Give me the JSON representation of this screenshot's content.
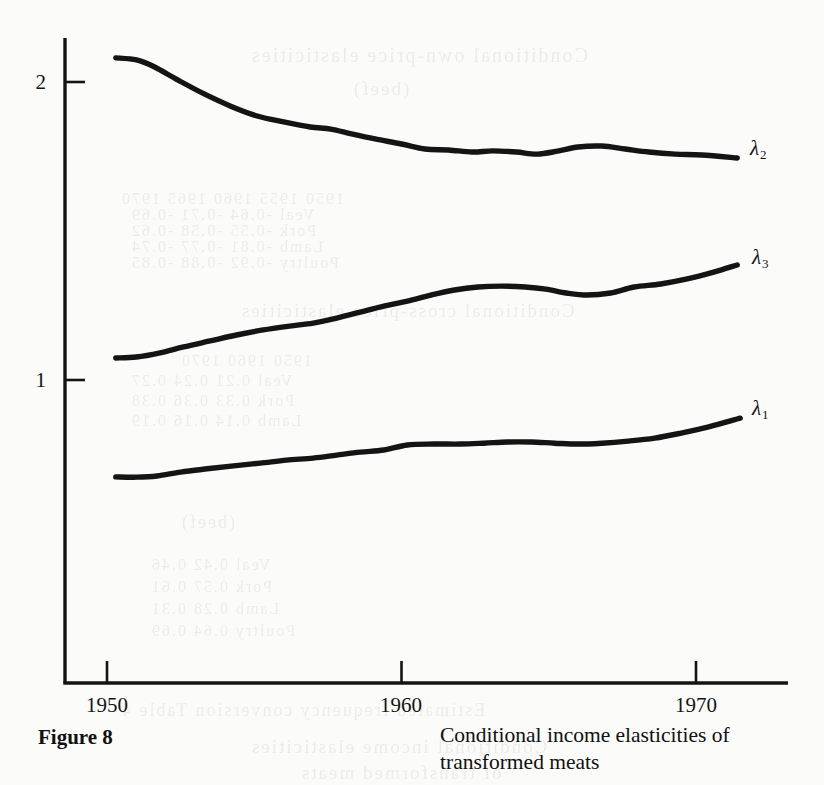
{
  "figure": {
    "number_label": "Figure 8",
    "caption": "Conditional income elasticities of transformed meats"
  },
  "axes": {
    "y_ticks": [
      {
        "label": "2",
        "value": 2
      },
      {
        "label": "1",
        "value": 1
      }
    ],
    "x_ticks": [
      {
        "label": "1950",
        "value": 1950
      },
      {
        "label": "1960",
        "value": 1960
      },
      {
        "label": "1970",
        "value": 1970
      }
    ]
  },
  "series_labels": {
    "lambda2": {
      "glyph": "λ",
      "subscript": "2"
    },
    "lambda3": {
      "glyph": "λ",
      "subscript": "3"
    },
    "lambda1": {
      "glyph": "λ",
      "subscript": "1"
    }
  },
  "ghost_text": {
    "rows": [
      {
        "text": "Conditional own-price elasticities",
        "x": 250,
        "y": 44,
        "size": 20
      },
      {
        "text": "(beef)",
        "x": 352,
        "y": 78,
        "size": 19
      },
      {
        "text": "1950      1955      1960      1965      1970",
        "x": 120,
        "y": 190,
        "size": 16
      },
      {
        "text": "Veal        -0.64     -0.71     -0.69",
        "x": 130,
        "y": 206,
        "size": 16
      },
      {
        "text": "Pork        -0.55     -0.58     -0.62",
        "x": 130,
        "y": 222,
        "size": 16
      },
      {
        "text": "Lamb        -0.81     -0.77     -0.74",
        "x": 130,
        "y": 238,
        "size": 16
      },
      {
        "text": "Poultry     -0.92     -0.88     -0.85",
        "x": 130,
        "y": 254,
        "size": 16
      },
      {
        "text": "Conditional cross-price elasticities",
        "x": 240,
        "y": 300,
        "size": 19
      },
      {
        "text": "1950      1960      1970",
        "x": 180,
        "y": 352,
        "size": 16
      },
      {
        "text": "Veal         0.21      0.24      0.27",
        "x": 130,
        "y": 372,
        "size": 16
      },
      {
        "text": "Pork         0.33      0.36      0.38",
        "x": 130,
        "y": 392,
        "size": 16
      },
      {
        "text": "Lamb         0.14      0.16      0.19",
        "x": 130,
        "y": 412,
        "size": 16
      },
      {
        "text": "(beef)",
        "x": 180,
        "y": 512,
        "size": 18
      },
      {
        "text": "Veal        0.42      0.46",
        "x": 150,
        "y": 556,
        "size": 16
      },
      {
        "text": "Pork        0.57      0.61",
        "x": 150,
        "y": 578,
        "size": 16
      },
      {
        "text": "Lamb        0.28      0.31",
        "x": 150,
        "y": 600,
        "size": 16
      },
      {
        "text": "Poultry     0.64      0.69",
        "x": 150,
        "y": 622,
        "size": 16
      },
      {
        "text": "Estimated frequency conversion  Table 4",
        "x": 120,
        "y": 700,
        "size": 18
      },
      {
        "text": "Conditional income elasticities",
        "x": 250,
        "y": 736,
        "size": 19
      },
      {
        "text": "of transformed meats",
        "x": 300,
        "y": 762,
        "size": 19
      }
    ]
  },
  "style": {
    "ink": "#141414",
    "paper": "#fbfbf9",
    "curve_width": 5.4,
    "axis_width": 3.4
  },
  "chart_data": {
    "type": "line",
    "title": "Conditional income elasticities of transformed meats",
    "xlabel": "",
    "ylabel": "",
    "xlim": [
      1946.8,
      1973.1
    ],
    "ylim": [
      0.0,
      2.16
    ],
    "grid": false,
    "legend": "inline-right-of-curve-ends",
    "y_tick_values": [
      1,
      2
    ],
    "x_tick_values": [
      1950,
      1960,
      1970
    ],
    "series": [
      {
        "name": "λ2",
        "label": "lambda_2",
        "x": [
          1950.3,
          1951.0,
          1951.6,
          1952.4,
          1953.3,
          1954.2,
          1955.1,
          1956.0,
          1956.9,
          1957.6,
          1958.3,
          1959.1,
          1960.0,
          1960.8,
          1961.6,
          1962.4,
          1963.1,
          1963.9,
          1964.6,
          1965.3,
          1966.0,
          1966.8,
          1967.6,
          1968.4,
          1969.3,
          1970.2,
          1971.4
        ],
        "y": [
          2.081,
          2.074,
          2.051,
          2.007,
          1.96,
          1.919,
          1.886,
          1.866,
          1.849,
          1.842,
          1.826,
          1.809,
          1.792,
          1.775,
          1.772,
          1.765,
          1.769,
          1.765,
          1.758,
          1.768,
          1.782,
          1.785,
          1.775,
          1.765,
          1.758,
          1.755,
          1.745
        ]
      },
      {
        "name": "λ3",
        "label": "lambda_3",
        "x": [
          1950.3,
          1951.0,
          1951.8,
          1952.6,
          1953.5,
          1954.4,
          1955.3,
          1956.2,
          1957.0,
          1957.8,
          1958.6,
          1959.4,
          1960.2,
          1961.0,
          1961.8,
          1962.6,
          1963.4,
          1964.2,
          1964.9,
          1965.6,
          1966.3,
          1967.1,
          1967.9,
          1968.8,
          1969.7,
          1970.6,
          1971.4
        ],
        "y": [
          1.074,
          1.077,
          1.091,
          1.111,
          1.131,
          1.151,
          1.168,
          1.181,
          1.191,
          1.208,
          1.228,
          1.248,
          1.265,
          1.285,
          1.302,
          1.312,
          1.315,
          1.312,
          1.305,
          1.292,
          1.285,
          1.292,
          1.312,
          1.322,
          1.339,
          1.362,
          1.386
        ]
      },
      {
        "name": "λ1",
        "label": "lambda_1",
        "x": [
          1950.3,
          1951.0,
          1951.7,
          1952.5,
          1953.4,
          1954.3,
          1955.2,
          1956.1,
          1957.0,
          1957.8,
          1958.6,
          1959.4,
          1960.2,
          1961.1,
          1962.0,
          1962.8,
          1963.6,
          1964.4,
          1965.2,
          1966.0,
          1966.8,
          1967.7,
          1968.6,
          1969.5,
          1970.4,
          1971.5
        ],
        "y": [
          0.675,
          0.674,
          0.678,
          0.691,
          0.702,
          0.712,
          0.721,
          0.731,
          0.738,
          0.748,
          0.758,
          0.765,
          0.782,
          0.785,
          0.785,
          0.788,
          0.792,
          0.792,
          0.788,
          0.785,
          0.788,
          0.795,
          0.805,
          0.822,
          0.842,
          0.872
        ]
      }
    ]
  }
}
